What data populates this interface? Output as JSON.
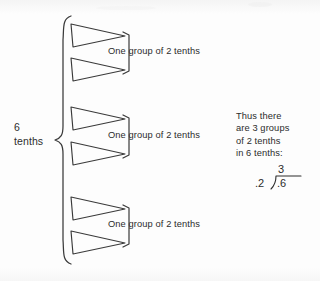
{
  "figure": {
    "title_text": "",
    "quantity_label": {
      "line1": "6",
      "line2": "tenths"
    },
    "groups": [
      {
        "caption": "One group of 2 tenths",
        "triangle_count": 2
      },
      {
        "caption": "One group of 2 tenths",
        "triangle_count": 2
      },
      {
        "caption": "One group of 2 tenths",
        "triangle_count": 2
      }
    ],
    "conclusion": {
      "line1": "Thus there",
      "line2": "are 3 groups",
      "line3": "of 2 tenths",
      "line4": "in 6 tenths:"
    },
    "division": {
      "quotient": "3",
      "divisor": ".2",
      "dividend": ".6"
    },
    "colors": {
      "background": "#fdfdfd",
      "ink": "#2f2f2f",
      "stroke": "#3a3a3a"
    }
  }
}
